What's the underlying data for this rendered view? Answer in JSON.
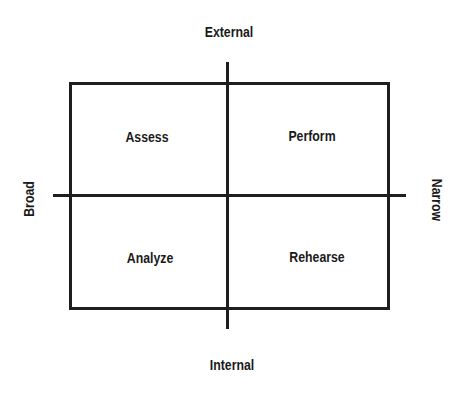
{
  "diagram": {
    "type": "2x2-quadrant",
    "axes": {
      "top": "External",
      "bottom": "Internal",
      "left": "Broad",
      "right": "Narrow"
    },
    "quadrants": {
      "top_left": "Assess",
      "top_right": "Perform",
      "bottom_left": "Analyze",
      "bottom_right": "Rehearse"
    },
    "colors": {
      "line": "#1e1e1e",
      "text": "#1a1a1a",
      "background": "#ffffff"
    }
  }
}
